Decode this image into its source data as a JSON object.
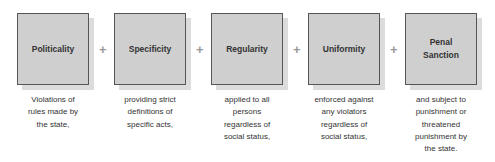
{
  "diagram": {
    "operator": "+",
    "elements": [
      {
        "label": "Politicality",
        "description": [
          "Violations of",
          "rules made by",
          "the state,"
        ]
      },
      {
        "label": "Specificity",
        "description": [
          "providing strict",
          "definitions of",
          "specific acts,"
        ]
      },
      {
        "label": "Regularity",
        "description": [
          "applied to all",
          "persons",
          "regardless of",
          "social status,"
        ]
      },
      {
        "label": "Uniformity",
        "description": [
          "enforced against",
          "any violators",
          "regardless of",
          "social status,"
        ]
      },
      {
        "label": "Penal Sanction",
        "label_lines": [
          "Penal",
          "Sanction"
        ],
        "description": [
          "and subject to",
          "punishment or",
          "threatened",
          "punishment by",
          "the state."
        ]
      }
    ]
  },
  "colors": {
    "box_fill": "#cfcfcf",
    "box_border": "#555555",
    "shadow": "#dcdcdc",
    "plus": "#999999",
    "text": "#333333"
  }
}
